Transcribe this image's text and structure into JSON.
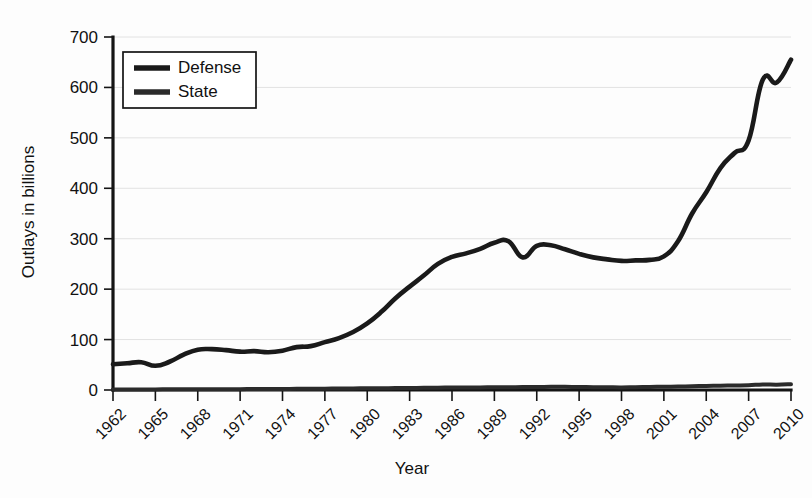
{
  "chart_data": {
    "type": "line",
    "title": "",
    "xlabel": "Year",
    "ylabel": "Outlays in billions",
    "xlim": [
      1962,
      2010
    ],
    "ylim": [
      0,
      700
    ],
    "grid": true,
    "legend_position": "top-left",
    "y_ticks": [
      0,
      100,
      200,
      300,
      400,
      500,
      600,
      700
    ],
    "x_ticks": [
      1962,
      1965,
      1968,
      1971,
      1974,
      1977,
      1980,
      1983,
      1986,
      1989,
      1992,
      1995,
      1998,
      2001,
      2004,
      2007,
      2010
    ],
    "x_tick_labels": [
      "1962",
      "1965",
      "1968",
      "1971",
      "1974",
      "1977",
      "1980",
      "1983",
      "1986",
      "1989",
      "1992",
      "1995",
      "1998",
      "2001",
      "2004",
      "2007",
      "2010"
    ],
    "y_tick_labels": [
      "0",
      "100",
      "200",
      "300",
      "400",
      "500",
      "600",
      "700"
    ],
    "x": [
      1962,
      1963,
      1964,
      1965,
      1966,
      1967,
      1968,
      1969,
      1970,
      1971,
      1972,
      1973,
      1974,
      1975,
      1976,
      1977,
      1978,
      1979,
      1980,
      1981,
      1982,
      1983,
      1984,
      1985,
      1986,
      1987,
      1988,
      1989,
      1990,
      1991,
      1992,
      1993,
      1994,
      1995,
      1996,
      1997,
      1998,
      1999,
      2000,
      2001,
      2002,
      2003,
      2004,
      2005,
      2006,
      2007,
      2008,
      2009,
      2010
    ],
    "series": [
      {
        "name": "Defense",
        "color": "#1a1a1a",
        "values": [
          51,
          53,
          55,
          48,
          56,
          70,
          80,
          81,
          79,
          76,
          77,
          75,
          78,
          85,
          87,
          95,
          103,
          115,
          132,
          155,
          182,
          205,
          227,
          250,
          264,
          271,
          280,
          292,
          295,
          263,
          286,
          287,
          279,
          270,
          263,
          259,
          256,
          257,
          258,
          265,
          295,
          350,
          392,
          440,
          470,
          495,
          615,
          610,
          655
        ]
      },
      {
        "name": "State",
        "color": "#2b2b2b",
        "values": [
          1.0,
          1.1,
          1.2,
          1.2,
          1.3,
          1.4,
          1.5,
          1.5,
          1.6,
          1.7,
          1.9,
          2.0,
          2.1,
          2.3,
          2.5,
          2.7,
          2.9,
          3.1,
          3.4,
          3.6,
          3.8,
          4.1,
          4.3,
          4.6,
          4.8,
          5.0,
          5.2,
          5.4,
          5.6,
          5.8,
          6.0,
          6.2,
          6.2,
          6.0,
          5.6,
          5.4,
          5.2,
          5.6,
          6.0,
          6.4,
          6.8,
          7.4,
          8.0,
          8.6,
          9.0,
          9.4,
          11.0,
          10.6,
          11.5
        ]
      }
    ]
  },
  "legend": {
    "items": [
      {
        "label": "Defense"
      },
      {
        "label": "State"
      }
    ]
  },
  "axes": {
    "y_title": "Outlays in billions",
    "x_title": "Year"
  }
}
